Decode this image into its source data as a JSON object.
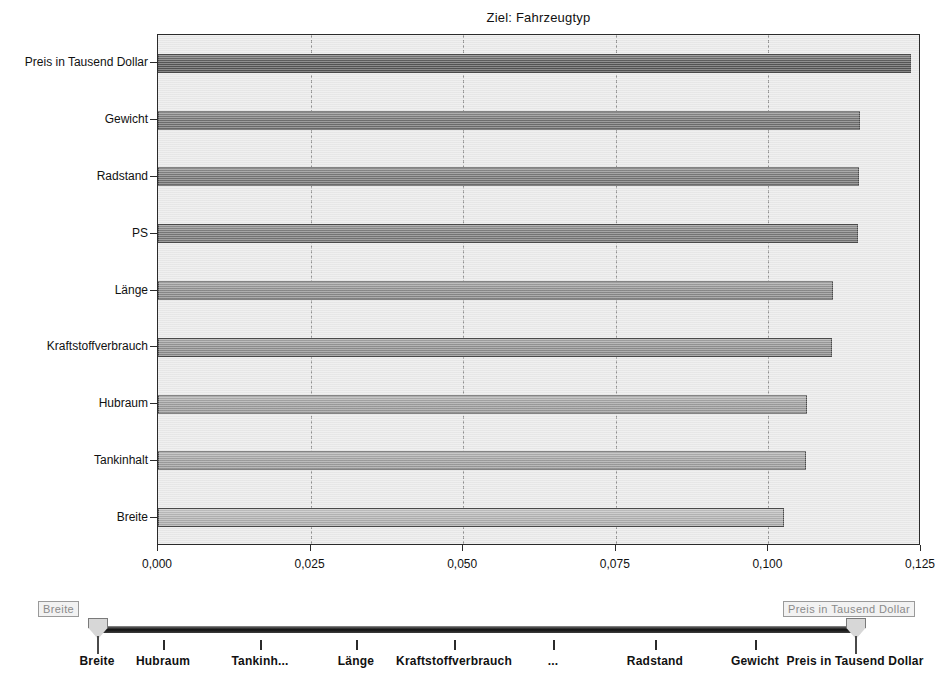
{
  "chart_data": {
    "type": "bar",
    "orientation": "horizontal",
    "title": "Ziel: Fahrzeugtyp",
    "xlabel": "",
    "ylabel": "",
    "xlim": [
      0.0,
      0.125
    ],
    "xticks": [
      0.0,
      0.025,
      0.05,
      0.075,
      0.1,
      0.125
    ],
    "xtick_labels": [
      "0,000",
      "0,025",
      "0,050",
      "0,075",
      "0,100",
      "0,125"
    ],
    "grid": "vertical-dashed",
    "legend": "none",
    "categories": [
      "Preis in Tausend Dollar",
      "Gewicht",
      "Radstand",
      "PS",
      "Länge",
      "Kraftstoffverbrauch",
      "Hubraum",
      "Tankinhalt",
      "Breite"
    ],
    "values": [
      0.1234,
      0.115,
      0.1148,
      0.1146,
      0.1106,
      0.1104,
      0.1064,
      0.1062,
      0.1025
    ],
    "bar_colors": [
      "#555555",
      "#6f6f6f",
      "#737373",
      "#767676",
      "#8a8a8a",
      "#8d8d8d",
      "#9b9b9b",
      "#9e9e9e",
      "#b0b0b0"
    ],
    "plot_background": "#e9e9e9",
    "frame_color": "#2b2b2b",
    "gridline_color": "#8e8e8e"
  },
  "slider": {
    "name": "variable-importance-range-slider",
    "left_tooltip": "Breite",
    "right_tooltip": "Preis in Tausend Dollar",
    "left_value": "Breite",
    "right_value": "Preis in Tausend Dollar",
    "tick_labels": [
      "Breite",
      "Hubraum",
      "Tankinh...",
      "Länge",
      "Kraftstoffverbrauch",
      "...",
      "Radstand",
      "Gewicht",
      "Preis in Tausend Dollar"
    ],
    "tick_positions_px": [
      97,
      163,
      260,
      356,
      454,
      553,
      655,
      755,
      855
    ],
    "label_positions_px": [
      97,
      163,
      260,
      356,
      454,
      553,
      655,
      755,
      855
    ]
  }
}
